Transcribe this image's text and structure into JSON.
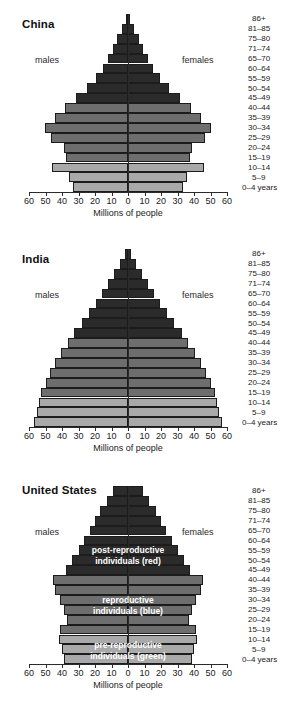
{
  "figure": {
    "kind": "population-pyramids",
    "axis_title": "Millions of people",
    "males_label": "males",
    "females_label": "females",
    "age_groups": [
      "86+",
      "81–85",
      "75–80",
      "71–74",
      "65–70",
      "60–64",
      "55–59",
      "50–54",
      "45–49",
      "40–44",
      "35–39",
      "30–34",
      "25–29",
      "20–24",
      "15–19",
      "10–14",
      "5–9",
      "0–4 years"
    ],
    "tick_labels": [
      "60",
      "50",
      "40",
      "30",
      "20",
      "10",
      "0",
      "10",
      "20",
      "30",
      "40",
      "50",
      "60"
    ],
    "colors": {
      "post_reproductive": "#2b2b2b",
      "reproductive": "#6e6e6e",
      "pre_reproductive": "#a9a9a9",
      "outline": "#1c1c1c",
      "axis": "#2b2b2b",
      "text": "#1a1a1a",
      "overlay_text": "#ffffff",
      "background": "#ffffff"
    },
    "overlay_labels": {
      "post": [
        "post-reproductive",
        "individuals (red)"
      ],
      "repro": [
        "reproductive",
        "individuals (blue)"
      ],
      "pre": [
        "pre-reproductive",
        "individuals (green)"
      ]
    }
  },
  "chart_data": [
    {
      "type": "bar",
      "title": "China",
      "xlabel": "Millions of people",
      "ylabel": "",
      "xlim": [
        -60,
        60
      ],
      "grid": false,
      "categories": [
        "86+",
        "81–85",
        "75–80",
        "71–74",
        "65–70",
        "60–64",
        "55–59",
        "50–54",
        "45–49",
        "40–44",
        "35–39",
        "30–34",
        "25–29",
        "20–24",
        "15–19",
        "10–14",
        "5–9",
        "0–4 years"
      ],
      "series": [
        {
          "name": "males",
          "values": [
            1.5,
            3.5,
            6.5,
            9.0,
            12.0,
            15.0,
            19.5,
            25.0,
            31.5,
            38.0,
            44.0,
            50.5,
            46.5,
            39.0,
            37.5,
            46.0,
            36.0,
            33.5
          ]
        },
        {
          "name": "females",
          "values": [
            1.5,
            3.5,
            6.5,
            9.0,
            12.0,
            15.0,
            19.5,
            25.0,
            31.5,
            38.0,
            44.0,
            50.5,
            46.5,
            39.0,
            37.5,
            46.0,
            36.0,
            33.5
          ]
        }
      ],
      "bands": {
        "post_reproductive": "86+ … 45–49",
        "reproductive": "40–44 … 15–19",
        "pre_reproductive": "10–14 … 0–4 years"
      }
    },
    {
      "type": "bar",
      "title": "India",
      "xlabel": "Millions of people",
      "ylabel": "",
      "xlim": [
        -60,
        60
      ],
      "grid": false,
      "categories": [
        "86+",
        "81–85",
        "75–80",
        "71–74",
        "65–70",
        "60–64",
        "55–59",
        "50–54",
        "45–49",
        "40–44",
        "35–39",
        "30–34",
        "25–29",
        "20–24",
        "15–19",
        "10–14",
        "5–9",
        "0–4 years"
      ],
      "series": [
        {
          "name": "males",
          "values": [
            2.0,
            5.0,
            8.5,
            12.0,
            15.5,
            19.5,
            23.5,
            28.0,
            32.5,
            36.5,
            40.5,
            44.0,
            47.5,
            50.0,
            52.5,
            54.0,
            55.0,
            57.0
          ]
        },
        {
          "name": "females",
          "values": [
            2.0,
            5.0,
            8.5,
            12.0,
            15.5,
            19.5,
            23.5,
            28.0,
            32.5,
            36.5,
            40.5,
            44.0,
            47.5,
            50.0,
            52.5,
            54.0,
            55.0,
            57.0
          ]
        }
      ],
      "bands": {
        "post_reproductive": "86+ … 45–49",
        "reproductive": "40–44 … 15–19",
        "pre_reproductive": "10–14 … 0–4 years"
      }
    },
    {
      "type": "bar",
      "title": "United States",
      "xlabel": "Millions of people",
      "ylabel": "",
      "xlim": [
        -60,
        60
      ],
      "grid": false,
      "categories": [
        "86+",
        "81–85",
        "75–80",
        "71–74",
        "65–70",
        "60–64",
        "55–59",
        "50–54",
        "45–49",
        "40–44",
        "35–39",
        "30–34",
        "25–29",
        "20–24",
        "15–19",
        "10–14",
        "5–9",
        "0–4 years"
      ],
      "series": [
        {
          "name": "males",
          "values": [
            9.0,
            13.0,
            17.0,
            20.0,
            23.0,
            26.5,
            30.0,
            34.0,
            37.5,
            45.5,
            44.0,
            41.0,
            39.0,
            37.0,
            41.5,
            42.0,
            40.0,
            38.5
          ]
        },
        {
          "name": "females",
          "values": [
            9.0,
            13.0,
            17.0,
            20.0,
            23.0,
            26.5,
            30.0,
            34.0,
            37.5,
            45.5,
            44.0,
            41.0,
            39.0,
            37.0,
            41.5,
            42.0,
            40.0,
            38.5
          ]
        }
      ],
      "bands": {
        "post_reproductive": "86+ … 45–49",
        "reproductive": "40–44 … 15–19",
        "pre_reproductive": "10–14 … 0–4 years"
      },
      "annotations": [
        {
          "text": "post-reproductive individuals (red)",
          "band": "post_reproductive"
        },
        {
          "text": "reproductive individuals (blue)",
          "band": "reproductive"
        },
        {
          "text": "pre-reproductive individuals (green)",
          "band": "pre_reproductive"
        }
      ]
    }
  ]
}
